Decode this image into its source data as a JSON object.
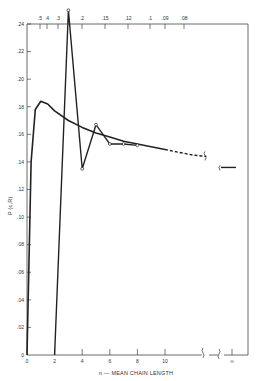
{
  "chart_data": {
    "type": "line",
    "title": "",
    "xlabel": "n — MEAN CHAIN LENGTH",
    "ylabel": "P (c,R)",
    "xlim": [
      0,
      10
    ],
    "ylim": [
      0,
      0.24
    ],
    "x_ticks": [
      "0",
      "2",
      "4",
      "6",
      "8",
      "10",
      "∞"
    ],
    "y_ticks": [
      "0",
      ".02",
      ".04",
      ".06",
      ".08",
      ".10",
      ".12",
      ".14",
      ".16",
      ".18",
      ".20",
      ".22",
      ".24"
    ],
    "top_axis_ticks": [
      ".5",
      ".4",
      ".3",
      ".2",
      ".15",
      ".12",
      ".1",
      ".09",
      ".08"
    ],
    "grid": false,
    "legend": null,
    "annotations": [
      "axis break marks between 10 and ∞"
    ],
    "series": [
      {
        "name": "smooth curve",
        "style": "solid, dashed beyond n=10",
        "x": [
          0,
          0.3,
          0.6,
          1.0,
          1.5,
          2,
          3,
          4,
          5,
          6,
          7,
          8,
          9,
          10,
          11,
          12,
          13
        ],
        "y": [
          0,
          0.14,
          0.178,
          0.184,
          0.182,
          0.177,
          0.17,
          0.165,
          0.161,
          0.158,
          0.155,
          0.153,
          0.151,
          0.149,
          0.147,
          0.145,
          0.144
        ]
      },
      {
        "name": "oscillating points",
        "style": "solid with open markers",
        "x": [
          2,
          3,
          4,
          5,
          6,
          7,
          8
        ],
        "y": [
          0,
          0.25,
          0.135,
          0.167,
          0.153,
          0.153,
          0.152
        ]
      },
      {
        "name": "limit value at infinity",
        "style": "solid short segment",
        "x": [
          "∞"
        ],
        "y": [
          0.136
        ]
      }
    ]
  }
}
